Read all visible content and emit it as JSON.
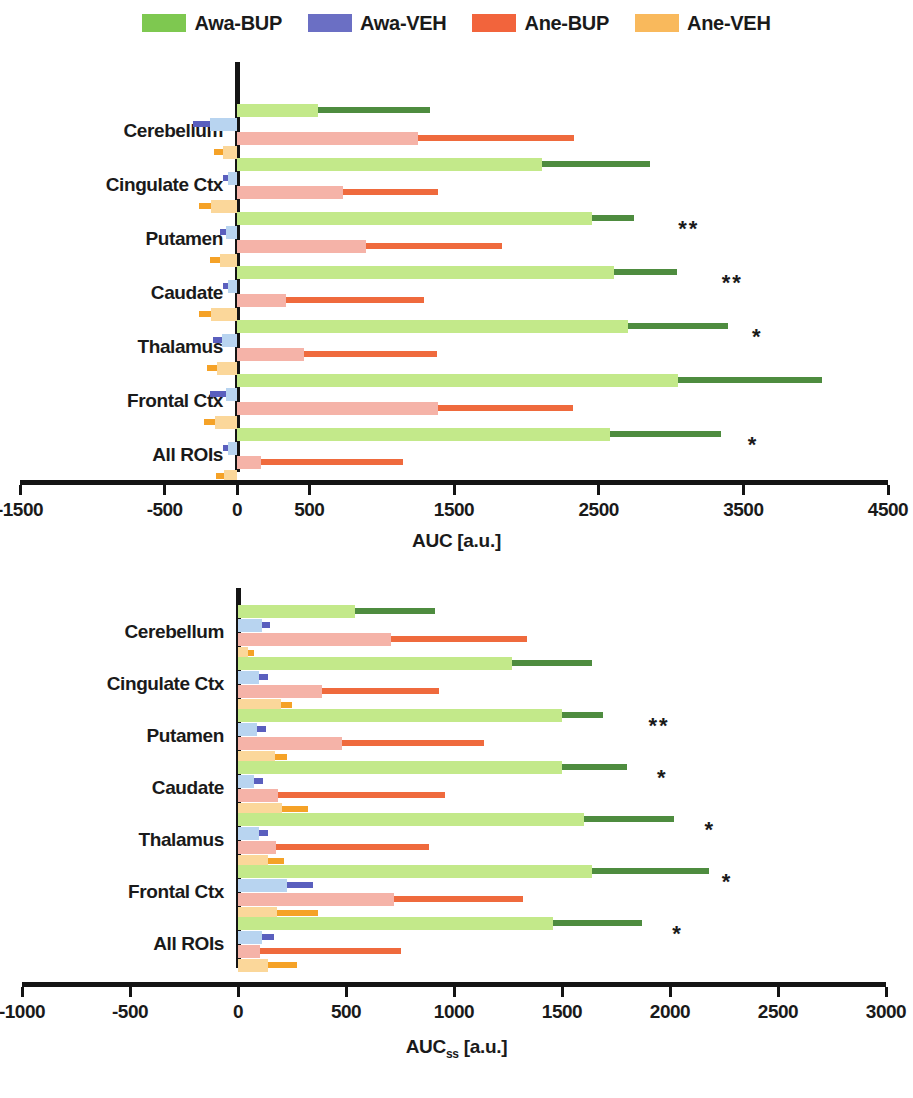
{
  "legend": {
    "items": [
      {
        "label": "Awa-BUP",
        "color": "#7ec850",
        "swatch_name": "legend-swatch-awa-bup"
      },
      {
        "label": "Awa-VEH",
        "color": "#6b6fc4",
        "swatch_name": "legend-swatch-awa-veh"
      },
      {
        "label": "Ane-BUP",
        "color": "#f2643c",
        "swatch_name": "legend-swatch-ane-bup"
      },
      {
        "label": "Ane-VEH",
        "color": "#f9b95c",
        "swatch_name": "legend-swatch-ane-veh"
      }
    ]
  },
  "series_colors": {
    "awa_bup_fill": "#c3e98a",
    "awa_bup_err": "#4e8c3f",
    "awa_veh_fill": "#b8d4f0",
    "awa_veh_err": "#5a5fbe",
    "ane_bup_fill": "#f5b3a8",
    "ane_bup_err": "#ef6a3d",
    "ane_veh_fill": "#fbd79a",
    "ane_veh_err": "#f5a227"
  },
  "chart_data": [
    {
      "id": "auc",
      "type": "bar",
      "orientation": "horizontal",
      "title": "",
      "xlabel": "AUC [a.u.]",
      "ylabel": "",
      "xlim": [
        -1500,
        4500
      ],
      "xticks": [
        -1500,
        -500,
        0,
        500,
        1500,
        2500,
        3500,
        4500
      ],
      "xticklabels": [
        "-1500",
        "-500",
        "0",
        "500",
        "1500",
        "2500",
        "3500",
        "4500"
      ],
      "grid": false,
      "legend_position": "top-center",
      "categories": [
        "Cerebellum",
        "Cingulate Ctx",
        "Putamen",
        "Caudate",
        "Thalamus",
        "Frontal Ctx",
        "All ROIs"
      ],
      "series": [
        {
          "name": "Awa-BUP",
          "values": [
            563,
            2106,
            2451,
            2606,
            2704,
            3049,
            2577
          ],
          "errors": [
            768,
            746,
            295,
            436,
            690,
            993,
            768
          ]
        },
        {
          "name": "Awa-VEH",
          "values": [
            -190,
            -60,
            -75,
            -60,
            -105,
            -75,
            -60
          ],
          "errors": [
            115,
            35,
            40,
            35,
            60,
            110,
            35
          ]
        },
        {
          "name": "Ane-BUP",
          "values": [
            1254,
            733,
            894,
            338,
            465,
            1387,
            169
          ],
          "errors": [
            1077,
            654,
            937,
            958,
            915,
            937,
            979
          ]
        },
        {
          "name": "Ane-VEH",
          "values": [
            -100,
            -180,
            -120,
            -180,
            -140,
            -150,
            -90
          ],
          "errors": [
            60,
            80,
            70,
            80,
            70,
            75,
            55
          ]
        }
      ],
      "annotations": [
        {
          "category": "Putamen",
          "text": "**",
          "x": 3050
        },
        {
          "category": "Caudate",
          "text": "**",
          "x": 3350
        },
        {
          "category": "Thalamus",
          "text": "*",
          "x": 3560
        },
        {
          "category": "All ROIs",
          "text": "*",
          "x": 3530
        }
      ]
    },
    {
      "id": "auc-ss",
      "type": "bar",
      "orientation": "horizontal",
      "title": "",
      "xlabel": "AUCss [a.u.]",
      "xlabel_base": "AUC",
      "xlabel_sub": "ss",
      "xlabel_tail": " [a.u.]",
      "ylabel": "",
      "xlim": [
        -1000,
        3000
      ],
      "xticks": [
        -1000,
        -500,
        0,
        500,
        1000,
        1500,
        2000,
        2500,
        3000
      ],
      "xticklabels": [
        "-1000",
        "-500",
        "0",
        "500",
        "1000",
        "1500",
        "2000",
        "2500",
        "3000"
      ],
      "grid": false,
      "legend_position": "top-center",
      "categories": [
        "Cerebellum",
        "Cingulate Ctx",
        "Putamen",
        "Caudate",
        "Thalamus",
        "Frontal Ctx",
        "All ROIs"
      ],
      "series": [
        {
          "name": "Awa-BUP",
          "values": [
            540,
            1270,
            1500,
            1500,
            1600,
            1640,
            1460
          ],
          "errors": [
            370,
            370,
            190,
            300,
            420,
            540,
            410
          ]
        },
        {
          "name": "Awa-VEH",
          "values": [
            110,
            95,
            90,
            75,
            95,
            225,
            110
          ],
          "errors": [
            40,
            45,
            40,
            40,
            45,
            120,
            55
          ]
        },
        {
          "name": "Ane-BUP",
          "values": [
            710,
            390,
            480,
            185,
            175,
            720,
            100
          ],
          "errors": [
            630,
            540,
            660,
            775,
            710,
            600,
            655
          ]
        },
        {
          "name": "Ane-VEH",
          "values": [
            45,
            200,
            170,
            205,
            140,
            180,
            140
          ],
          "errors": [
            30,
            50,
            55,
            120,
            75,
            190,
            135
          ]
        }
      ],
      "annotations": [
        {
          "category": "Putamen",
          "text": "**",
          "x": 1900
        },
        {
          "category": "Caudate",
          "text": "*",
          "x": 1940
        },
        {
          "category": "Thalamus",
          "text": "*",
          "x": 2160
        },
        {
          "category": "Frontal Ctx",
          "text": "*",
          "x": 2240
        },
        {
          "category": "All ROIs",
          "text": "*",
          "x": 2010
        }
      ]
    }
  ]
}
